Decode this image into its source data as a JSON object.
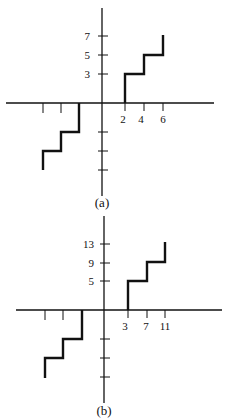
{
  "panels": [
    {
      "caption": "(a)",
      "x_tick_labels": [
        "2",
        "4",
        "6"
      ],
      "y_tick_labels": [
        "3",
        "5",
        "7"
      ],
      "steps_positive": [
        {
          "x_from": 2,
          "x_to": 4,
          "y": 3
        },
        {
          "x_from": 4,
          "x_to": 6,
          "y": 5
        },
        {
          "x_from": 6,
          "x_to": 6,
          "y": 7
        }
      ],
      "description": "Staircase function with jumps at x = 2, 4, 6 to levels 3, 5, 7; symmetric negative staircase"
    },
    {
      "caption": "(b)",
      "x_tick_labels": [
        "3",
        "7",
        "11"
      ],
      "y_tick_labels": [
        "5",
        "9",
        "13"
      ],
      "steps_positive": [
        {
          "x_from": 3,
          "x_to": 7,
          "y": 5
        },
        {
          "x_from": 7,
          "x_to": 11,
          "y": 9
        },
        {
          "x_from": 11,
          "x_to": 11,
          "y": 13
        }
      ],
      "description": "Staircase function with jumps at x = 3, 7, 11 to levels 5, 9, 13; symmetric negative staircase"
    }
  ]
}
